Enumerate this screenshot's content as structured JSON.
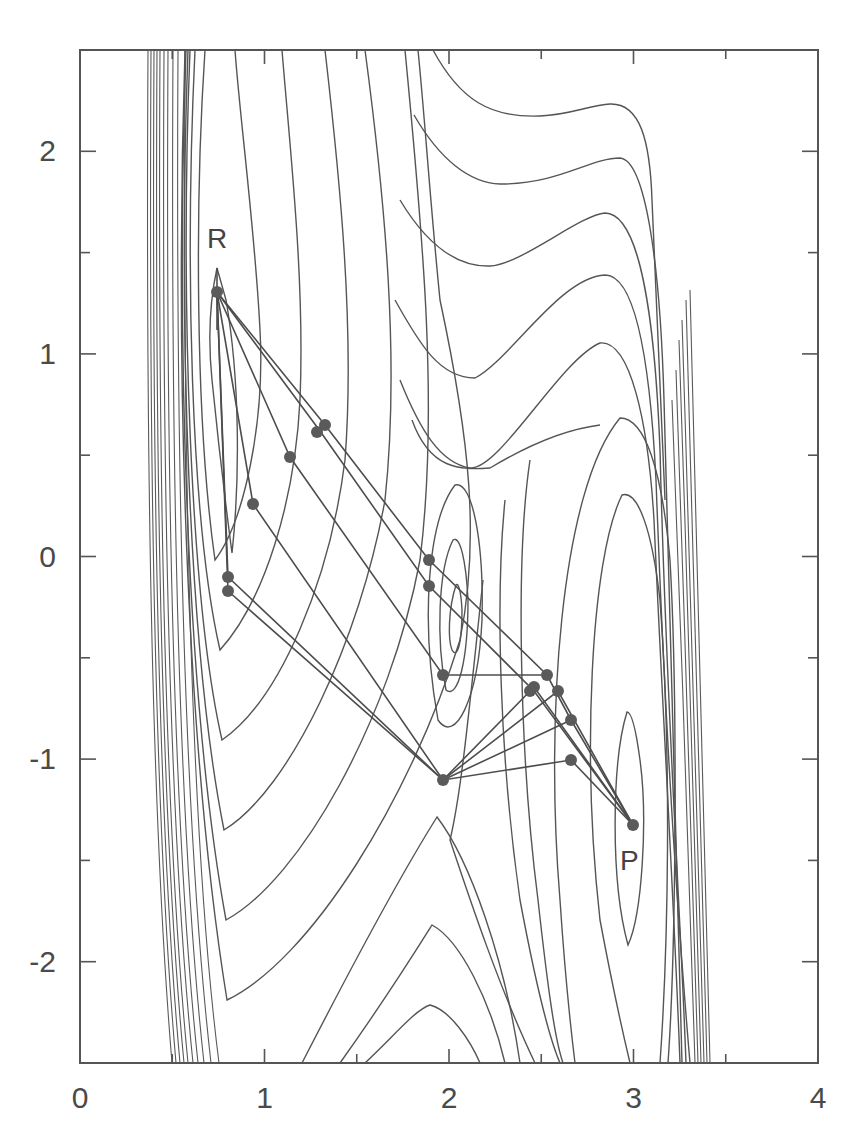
{
  "chart_data": {
    "type": "scatter",
    "subtype": "contour plot with reaction path network",
    "title": "",
    "xlabel": "",
    "ylabel": "",
    "xlim": [
      0,
      4
    ],
    "ylim": [
      -2.5,
      2.5
    ],
    "grid": false,
    "legend": null,
    "x_ticks": {
      "major": [
        0,
        1,
        2,
        3,
        4
      ],
      "labels": [
        "0",
        "1",
        "2",
        "3",
        "4"
      ],
      "minor_step": 0.5
    },
    "y_ticks": {
      "major": [
        -2,
        -1,
        0,
        1,
        2
      ],
      "labels": [
        "-2",
        "-1",
        "0",
        "1",
        "2"
      ],
      "minor_step": 0.5
    },
    "annotations": [
      {
        "text": "R",
        "x": 0.72,
        "y": 1.55,
        "meaning": "reactant minimum"
      },
      {
        "text": "P",
        "x": 3.0,
        "y": -1.5,
        "meaning": "product minimum"
      }
    ],
    "stationary_points": {
      "reactant": {
        "x": 0.74,
        "y": 1.3
      },
      "intermediate_minimum": {
        "x": 2.0,
        "y": -0.3
      },
      "product": {
        "x": 3.0,
        "y": -1.32
      },
      "saddle": {
        "x": 1.97,
        "y": -1.1
      }
    },
    "series": [
      {
        "name": "path nodes",
        "points": [
          {
            "x": 0.74,
            "y": 1.3
          },
          {
            "x": 1.33,
            "y": 0.65
          },
          {
            "x": 1.3,
            "y": 0.62
          },
          {
            "x": 1.14,
            "y": 0.49
          },
          {
            "x": 0.94,
            "y": 0.26
          },
          {
            "x": 0.8,
            "y": -0.1
          },
          {
            "x": 0.8,
            "y": -0.17
          },
          {
            "x": 1.89,
            "y": -0.01
          },
          {
            "x": 1.89,
            "y": -0.14
          },
          {
            "x": 1.97,
            "y": -0.58
          },
          {
            "x": 1.97,
            "y": -1.1
          },
          {
            "x": 2.53,
            "y": -0.58
          },
          {
            "x": 2.46,
            "y": -0.64
          },
          {
            "x": 2.46,
            "y": -0.66
          },
          {
            "x": 2.59,
            "y": -0.66
          },
          {
            "x": 2.66,
            "y": -0.8
          },
          {
            "x": 2.66,
            "y": -1.0
          },
          {
            "x": 3.0,
            "y": -1.32
          }
        ]
      }
    ],
    "path_segments": [
      [
        [
          0.74,
          1.3
        ],
        [
          1.33,
          0.65
        ],
        [
          1.89,
          -0.01
        ],
        [
          2.53,
          -0.58
        ],
        [
          2.66,
          -0.8
        ],
        [
          3.0,
          -1.32
        ]
      ],
      [
        [
          0.74,
          1.3
        ],
        [
          1.3,
          0.62
        ],
        [
          1.89,
          -0.14
        ],
        [
          2.46,
          -0.66
        ],
        [
          3.0,
          -1.32
        ]
      ],
      [
        [
          0.74,
          1.3
        ],
        [
          1.14,
          0.49
        ],
        [
          1.97,
          -0.58
        ],
        [
          2.53,
          -0.58
        ]
      ],
      [
        [
          0.74,
          1.3
        ],
        [
          0.94,
          0.26
        ],
        [
          1.97,
          -1.1
        ],
        [
          2.66,
          -1.0
        ],
        [
          3.0,
          -1.32
        ]
      ],
      [
        [
          0.74,
          1.3
        ],
        [
          0.8,
          -0.1
        ],
        [
          1.97,
          -1.1
        ],
        [
          2.59,
          -0.66
        ],
        [
          3.0,
          -1.32
        ]
      ],
      [
        [
          0.74,
          1.3
        ],
        [
          0.8,
          -0.17
        ],
        [
          1.97,
          -1.1
        ],
        [
          2.46,
          -0.64
        ],
        [
          3.0,
          -1.32
        ]
      ],
      [
        [
          1.97,
          -1.1
        ],
        [
          2.66,
          -0.8
        ]
      ]
    ]
  }
}
